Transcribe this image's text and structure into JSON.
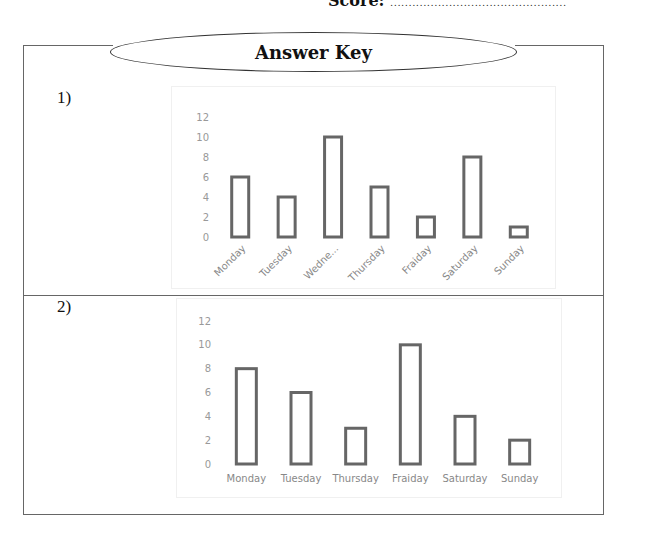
{
  "header": {
    "score_label": "Score:",
    "score_line": "................................................"
  },
  "title": "Answer Key",
  "questions": [
    {
      "number": "1)"
    },
    {
      "number": "2)"
    }
  ],
  "chart_data": [
    {
      "type": "bar",
      "title": "",
      "xlabel": "",
      "ylabel": "",
      "categories": [
        "Monday",
        "Tuesday",
        "Wedne...",
        "Thursday",
        "Fraiday",
        "Saturday",
        "Sunday"
      ],
      "values": [
        6,
        4,
        10,
        5,
        2,
        8,
        1
      ],
      "ylim": [
        0,
        12
      ],
      "yticks": [
        0,
        2,
        4,
        6,
        8,
        10,
        12
      ],
      "grid": false,
      "label_rotation": -45,
      "bar_style": "outline"
    },
    {
      "type": "bar",
      "title": "",
      "xlabel": "",
      "ylabel": "",
      "categories": [
        "Monday",
        "Tuesday",
        "Thursday",
        "Fraiday",
        "Saturday",
        "Sunday"
      ],
      "values": [
        8,
        6,
        3,
        10,
        4,
        2
      ],
      "ylim": [
        0,
        12
      ],
      "yticks": [
        0,
        2,
        4,
        6,
        8,
        10,
        12
      ],
      "grid": false,
      "label_rotation": 0,
      "bar_style": "outline"
    }
  ]
}
